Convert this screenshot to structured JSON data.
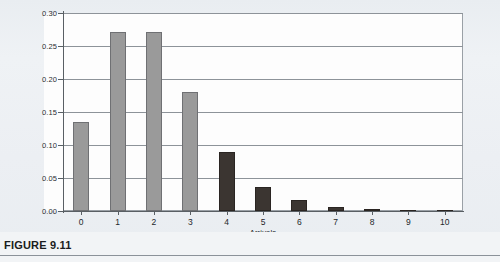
{
  "caption": {
    "label": "FIGURE 9.11"
  },
  "top_cut_text": "",
  "colors": {
    "light_bar": "#9a9a9a",
    "dark_bar": "#3b3531",
    "gridline": "#8d9399",
    "axis": "#595f64",
    "plot_background": "#fdfdfd",
    "page_background": "#eef1f4"
  },
  "chart_data": {
    "type": "bar",
    "title": "",
    "xlabel": "Arrivals",
    "ylabel": "",
    "categories": [
      "0",
      "1",
      "2",
      "3",
      "4",
      "5",
      "6",
      "7",
      "8",
      "9",
      "10"
    ],
    "values": [
      0.135,
      0.271,
      0.271,
      0.18,
      0.09,
      0.036,
      0.017,
      0.006,
      0.003,
      0.002,
      0.002
    ],
    "bar_colors": [
      "light",
      "light",
      "light",
      "light",
      "dark",
      "dark",
      "dark",
      "dark",
      "dark",
      "dark",
      "dark"
    ],
    "ylim": [
      0.0,
      0.3
    ],
    "ytick_labels": [
      "0.00",
      "0.05",
      "0.10",
      "0.15",
      "0.20",
      "0.25",
      "0.30"
    ],
    "ytick_values": [
      0.0,
      0.05,
      0.1,
      0.15,
      0.2,
      0.25,
      0.3
    ],
    "grid": true,
    "legend": false,
    "legend_position": "none"
  }
}
